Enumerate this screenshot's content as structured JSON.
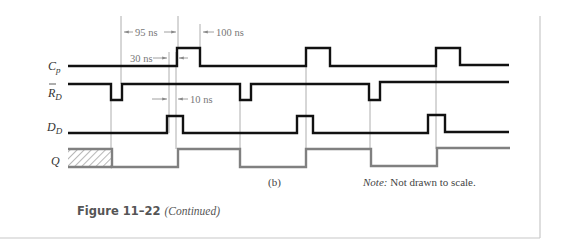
{
  "figure": {
    "caption_number": "Figure 11–22",
    "caption_suffix": "(Continued)",
    "part_label": "(b)",
    "note_prefix": "Note:",
    "note_text": " Not drawn to scale."
  },
  "signals": [
    {
      "name": "C",
      "subscript": "p",
      "overbar": false
    },
    {
      "name": "R",
      "subscript": "D",
      "overbar": true
    },
    {
      "name": "D",
      "subscript": "D",
      "overbar": false
    },
    {
      "name": "Q",
      "subscript": "",
      "overbar": false
    }
  ],
  "annotations": {
    "t1": "95 ns",
    "t2": "100 ns",
    "t3": "30 ns",
    "t4": "10 ns"
  },
  "colors": {
    "signal": "#111111",
    "output": "#808080",
    "marker": "#999999",
    "border": "#c8c8c8"
  }
}
